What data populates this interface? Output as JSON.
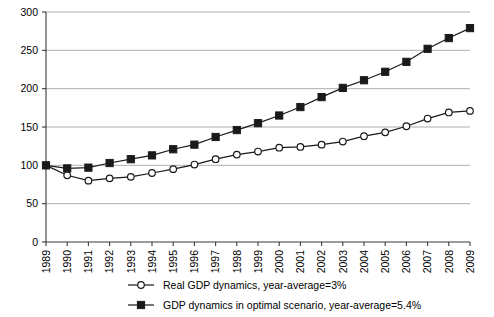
{
  "chart_data": {
    "type": "line",
    "title": "",
    "subtitle": "",
    "xlabel": "",
    "ylabel": "",
    "ylim": [
      0,
      300
    ],
    "ytick_step": 50,
    "yticks": [
      "0",
      "50",
      "100",
      "150",
      "200",
      "250",
      "300"
    ],
    "grid": true,
    "legend_position": "bottom",
    "categories": [
      "1989",
      "1990",
      "1991",
      "1992",
      "1993",
      "1994",
      "1995",
      "1996",
      "1997",
      "1998",
      "1999",
      "2000",
      "2001",
      "2002",
      "2003",
      "2004",
      "2005",
      "2006",
      "2007",
      "2008",
      "2009"
    ],
    "series": [
      {
        "name": "Real GDP dynamics, year-average=3%",
        "marker": "open-circle",
        "values": [
          100,
          87,
          80,
          83,
          85,
          90,
          95,
          101,
          108,
          114,
          118,
          123,
          124,
          127,
          131,
          138,
          143,
          151,
          161,
          169,
          171
        ]
      },
      {
        "name": "GDP dynamics in optimal scenario, year-average=5.4%",
        "marker": "filled-square",
        "values": [
          100,
          96,
          97,
          103,
          108,
          113,
          121,
          127,
          137,
          146,
          155,
          165,
          176,
          189,
          201,
          211,
          222,
          235,
          252,
          266,
          279
        ]
      }
    ],
    "colors": {
      "series_line": "#1a1a1a",
      "gridline": "#9a9a9a",
      "axis": "#3a3a3a",
      "background": "#ffffff"
    }
  },
  "legend": {
    "items": [
      {
        "label": "Real GDP dynamics, year-average=3%",
        "marker": "open-circle"
      },
      {
        "label": "GDP dynamics in optimal scenario, year-average=5.4%",
        "marker": "filled-square"
      }
    ]
  }
}
